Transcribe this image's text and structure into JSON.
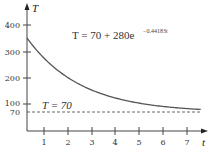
{
  "chart_data": {
    "type": "line",
    "title": "",
    "xlabel": "t",
    "ylabel": "T",
    "x_ticks": [
      1,
      2,
      3,
      4,
      5,
      6,
      7
    ],
    "y_ticks": [
      70,
      100,
      200,
      300,
      400
    ],
    "xlim": [
      0,
      7.5
    ],
    "ylim": [
      0,
      420
    ],
    "grid": false,
    "legend": null,
    "series": [
      {
        "name": "T = 70 + 280e^(-0.44183t)",
        "style": "solid",
        "x": [
          0,
          0.5,
          1,
          1.5,
          2,
          2.5,
          3,
          3.5,
          4,
          4.5,
          5,
          5.5,
          6,
          6.5,
          7,
          7.5
        ],
        "values": [
          350,
          294,
          250,
          213,
          185,
          162,
          144,
          130,
          118,
          108,
          101,
          95,
          90,
          86,
          83,
          81
        ]
      },
      {
        "name": "T = 70",
        "style": "dashed",
        "x": [
          0,
          7.5
        ],
        "values": [
          70,
          70
        ]
      }
    ],
    "annotations": [
      {
        "text": "T = 70 + 280e",
        "exponent": "−0.44183t",
        "position": "upper-middle"
      },
      {
        "text": "T = 70",
        "position": "above dashed asymptote"
      }
    ]
  },
  "labels": {
    "x_axis": "t",
    "y_axis": "T",
    "equation_main": "T = 70 + 280e",
    "equation_exp": "−0.44183t",
    "asymptote": "T = 70",
    "x_ticks": [
      "1",
      "2",
      "3",
      "4",
      "5",
      "6",
      "7"
    ],
    "y_ticks": [
      "400",
      "300",
      "200",
      "100",
      "70"
    ]
  },
  "colors": {
    "curve": "#555555",
    "axis": "#444444",
    "dashed": "#555555"
  }
}
